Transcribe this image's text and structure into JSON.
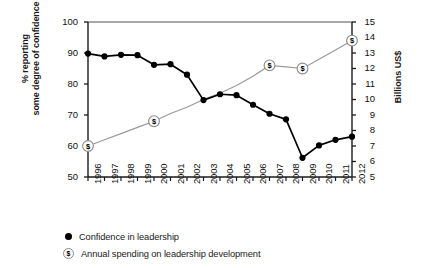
{
  "chart_data": {
    "type": "line",
    "title": "",
    "xlabel": "",
    "ylabel": "% reporting some degree of confidence",
    "ylabel_line1": "% reporting",
    "ylabel_line2": "some degree of confidence",
    "y2label": "Billions US$",
    "grid": false,
    "legend_position": "bottom-left",
    "ylim": [
      50,
      100
    ],
    "y2lim": [
      5,
      15
    ],
    "yticks": [
      100,
      90,
      80,
      70,
      60,
      50
    ],
    "y2ticks": [
      15,
      14,
      13,
      12,
      11,
      10,
      9,
      8,
      7,
      6,
      5
    ],
    "categories": [
      "1996",
      "1997",
      "1998",
      "1999",
      "2000",
      "2001",
      "2002",
      "2003",
      "2004",
      "2005",
      "2006",
      "2007",
      "2008",
      "2009",
      "2010",
      "2011",
      "2012"
    ],
    "x": [
      1996,
      1997,
      1998,
      1999,
      2000,
      2001,
      2002,
      2003,
      2004,
      2005,
      2006,
      2007,
      2008,
      2009,
      2010,
      2011,
      2012
    ],
    "series": [
      {
        "name": "Confidence in leadership",
        "axis": "left",
        "units": "% reporting some degree of confidence",
        "marker": "filled-circle",
        "color": "#000000",
        "values": [
          89.8,
          88.9,
          89.4,
          89.3,
          86.2,
          86.4,
          83.0,
          74.8,
          76.7,
          76.4,
          73.3,
          70.4,
          68.6,
          56.2,
          60.2,
          62.0,
          63.0
        ]
      },
      {
        "name": "Annual spending on leadership development",
        "axis": "right",
        "units": "Billions US$",
        "marker": "dollar-circle",
        "color": "#9a9a9a",
        "marker_years": [
          1996,
          2000,
          2007,
          2009,
          2012
        ],
        "values": [
          7.0,
          7.4,
          7.8,
          8.2,
          8.6,
          9.1,
          9.5,
          10.0,
          10.4,
          10.9,
          11.5,
          12.2,
          12.1,
          12.0,
          12.6,
          13.2,
          13.8
        ]
      }
    ],
    "legend": [
      {
        "label": "Confidence in leadership",
        "marker": "filled-circle"
      },
      {
        "label": "Annual spending on leadership development",
        "marker": "dollar-circle"
      }
    ]
  }
}
